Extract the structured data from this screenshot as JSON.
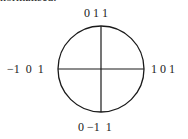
{
  "caption_clipped": "normalised:",
  "diagram": {
    "shape": "circle-with-cross",
    "labels": {
      "top": "0 1 1",
      "left": "−1  0  1",
      "right": "1 0 1",
      "bottom": "0 −1  1"
    },
    "stroke_color": "#1a1a1a"
  }
}
